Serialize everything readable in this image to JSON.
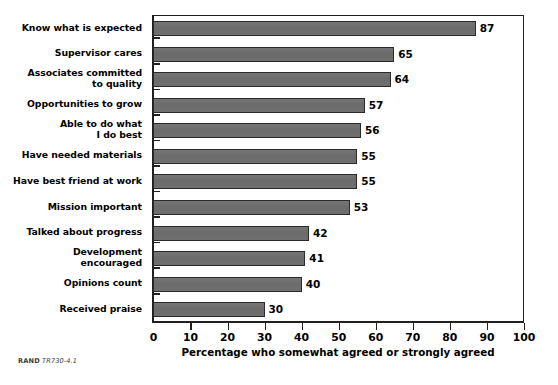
{
  "figure": {
    "footer_org": "RAND",
    "footer_id": "TR730-4.1"
  },
  "chart_data": {
    "type": "bar",
    "orientation": "horizontal",
    "title": "",
    "xlabel": "Percentage who somewhat agreed or strongly agreed",
    "ylabel": "",
    "xlim": [
      0,
      100
    ],
    "xticks": [
      0,
      10,
      20,
      30,
      40,
      50,
      60,
      70,
      80,
      90,
      100
    ],
    "xtick_labels": [
      "0",
      "10",
      "20",
      "30",
      "40",
      "50",
      "60",
      "70",
      "80",
      "90",
      "100"
    ],
    "grid": false,
    "legend": false,
    "bar_color": "#6f6f6f",
    "bar_edge_color": "#2a2a2a",
    "categories": [
      "Know what is expected",
      "Supervisor cares",
      "Associates committed to quality",
      "Opportunities to grow",
      "Able to do what I do best",
      "Have needed materials",
      "Have best friend at work",
      "Mission important",
      "Talked about progress",
      "Development encouraged",
      "Opinions count",
      "Received praise"
    ],
    "category_lines": [
      [
        "Know what is expected"
      ],
      [
        "Supervisor cares"
      ],
      [
        "Associates committed",
        "to quality"
      ],
      [
        "Opportunities to grow"
      ],
      [
        "Able to do what",
        "I do best"
      ],
      [
        "Have needed materials"
      ],
      [
        "Have best friend at work"
      ],
      [
        "Mission important"
      ],
      [
        "Talked about progress"
      ],
      [
        "Development",
        "encouraged"
      ],
      [
        "Opinions count"
      ],
      [
        "Received praise"
      ]
    ],
    "values": [
      87,
      65,
      64,
      57,
      56,
      55,
      55,
      53,
      42,
      41,
      40,
      30
    ],
    "value_labels": [
      "87",
      "65",
      "64",
      "57",
      "56",
      "55",
      "55",
      "53",
      "42",
      "41",
      "40",
      "30"
    ]
  }
}
